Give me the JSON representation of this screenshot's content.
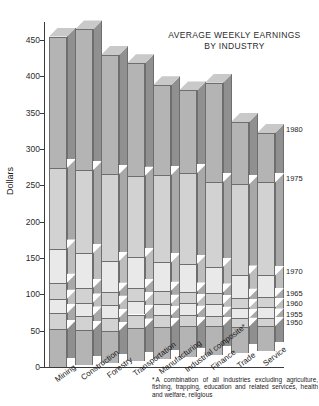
{
  "chart_data": {
    "type": "bar",
    "subtype": "stacked-column-3d",
    "title": "AVERAGE WEEKLY EARNINGS BY INDUSTRY",
    "title_lines": [
      "AVERAGE WEEKLY EARNINGS",
      "BY INDUSTRY"
    ],
    "xlabel": "",
    "ylabel": "Dollars",
    "ylim": [
      0,
      475
    ],
    "ytick_step": 50,
    "yticks": [
      0,
      50,
      100,
      150,
      200,
      250,
      300,
      350,
      400,
      450
    ],
    "ytick_labels": [
      "0",
      "50",
      "100",
      "150",
      "200",
      "250",
      "300",
      "350",
      "400",
      "450"
    ],
    "grid": false,
    "legend_position": "right-inline",
    "categories": [
      "Mining",
      "Construction",
      "Forestry",
      "Transportation",
      "Manufacturing",
      "Industrial composite*",
      "Finance",
      "Trade",
      "Service"
    ],
    "series": [
      {
        "name": "1950",
        "values": [
          52,
          48,
          44,
          46,
          44,
          42,
          40,
          36,
          34
        ]
      },
      {
        "name": "1955",
        "values": [
          74,
          68,
          62,
          64,
          60,
          58,
          54,
          48,
          46
        ]
      },
      {
        "name": "1960",
        "values": [
          94,
          86,
          80,
          82,
          76,
          74,
          70,
          62,
          60
        ]
      },
      {
        "name": "1965",
        "values": [
          116,
          106,
          98,
          100,
          94,
          90,
          86,
          76,
          74
        ]
      },
      {
        "name": "1970",
        "values": [
          163,
          154,
          140,
          143,
          133,
          128,
          121,
          108,
          104
        ]
      },
      {
        "name": "1975",
        "values": [
          274,
          268,
          260,
          255,
          253,
          253,
          238,
          232,
          232
        ]
      },
      {
        "name": "1980",
        "values": [
          455,
          462,
          424,
          410,
          377,
          367,
          375,
          318,
          300
        ]
      }
    ],
    "series_names": [
      "1950",
      "1955",
      "1960",
      "1965",
      "1970",
      "1975",
      "1980"
    ],
    "year_axis_labels": [
      "1980",
      "1975",
      "1970",
      "1965",
      "1960",
      "1955",
      "1950"
    ],
    "annotations": {
      "footnote_marker": "*",
      "footnote_lines": [
        "A combination of all industries excluding",
        "agriculture, fishing, trapping, education and",
        "related services, health and welfare, religious"
      ]
    }
  },
  "colors": {
    "background": "#ffffff",
    "axis": "#3a3a3a",
    "text": "#1c1c1c",
    "segment_outline": "#6e6e6e",
    "band_light": "#e9e9e9",
    "band_mid": "#d2d2d2",
    "band_dark": "#b4b4b4",
    "side_shade": "#a2a2a2",
    "top_cap": "#c9c9c9"
  }
}
